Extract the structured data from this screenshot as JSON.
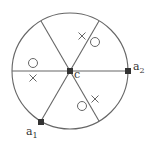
{
  "diagram": {
    "type": "circular-sector-diagram",
    "circle": {
      "cx": 70,
      "cy": 71,
      "r": 58,
      "stroke": "#666666"
    },
    "center": {
      "x": 70,
      "y": 71,
      "label": "c",
      "label_x": 74,
      "label_y": 78
    },
    "spokes": [
      {
        "x2": 12,
        "y2": 71
      },
      {
        "x2": 128,
        "y2": 71
      },
      {
        "x2": 41,
        "y2": 21
      },
      {
        "x2": 99,
        "y2": 21
      },
      {
        "x2": 41,
        "y2": 121
      },
      {
        "x2": 99,
        "y2": 121
      }
    ],
    "points": [
      {
        "id": "a1",
        "x": 41,
        "y": 122,
        "label": "a",
        "subscript": "1",
        "label_x": 26,
        "label_y": 135
      },
      {
        "id": "a2",
        "x": 128,
        "y": 71,
        "label": "a",
        "subscript": "2",
        "label_x": 133,
        "label_y": 70
      }
    ],
    "circles": [
      {
        "x": 33,
        "y": 63
      },
      {
        "x": 95,
        "y": 42
      },
      {
        "x": 82,
        "y": 106
      }
    ],
    "crosses": [
      {
        "x": 33,
        "y": 78
      },
      {
        "x": 82,
        "y": 36
      },
      {
        "x": 95,
        "y": 99
      }
    ]
  }
}
